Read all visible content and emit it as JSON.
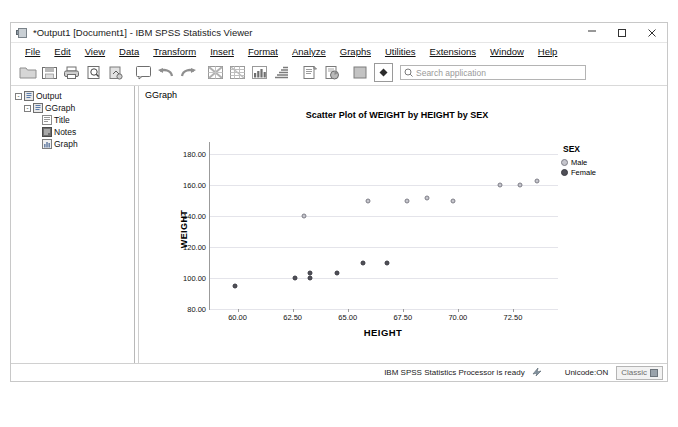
{
  "window": {
    "title": "*Output1 [Document1] - IBM SPSS Statistics Viewer",
    "icon": "spss-viewer-icon",
    "minimize": "minimize-icon",
    "maximize": "maximize-icon",
    "close": "close-icon"
  },
  "menu": [
    {
      "label": "File"
    },
    {
      "label": "Edit"
    },
    {
      "label": "View"
    },
    {
      "label": "Data"
    },
    {
      "label": "Transform"
    },
    {
      "label": "Insert"
    },
    {
      "label": "Format"
    },
    {
      "label": "Analyze"
    },
    {
      "label": "Graphs"
    },
    {
      "label": "Utilities"
    },
    {
      "label": "Extensions"
    },
    {
      "label": "Window"
    },
    {
      "label": "Help"
    }
  ],
  "toolbar": {
    "buttons": [
      {
        "name": "open-file-icon"
      },
      {
        "name": "save-icon"
      },
      {
        "name": "print-icon"
      },
      {
        "name": "print-preview-icon"
      },
      {
        "name": "export-icon"
      },
      {
        "name": "dialog-recall-icon"
      },
      {
        "name": "undo-icon"
      },
      {
        "name": "redo-icon"
      },
      {
        "name": "goto-data-icon"
      },
      {
        "name": "goto-case-icon"
      },
      {
        "name": "variables-icon"
      },
      {
        "name": "run-descriptives-icon"
      },
      {
        "name": "insert-text-icon"
      },
      {
        "name": "insert-object-icon"
      },
      {
        "name": "show-hide-icon"
      },
      {
        "name": "promote-icon"
      }
    ],
    "search": {
      "icon": "search-icon",
      "placeholder": "Search application",
      "value": ""
    }
  },
  "outline": {
    "items": [
      {
        "label": "Output",
        "icon": "output-icon",
        "level": 0,
        "expanded": true
      },
      {
        "label": "GGraph",
        "icon": "ggraph-icon",
        "level": 1,
        "expanded": true
      },
      {
        "label": "Title",
        "icon": "title-icon",
        "level": 2
      },
      {
        "label": "Notes",
        "icon": "notes-icon",
        "level": 2
      },
      {
        "label": "Graph",
        "icon": "graph-icon",
        "level": 2
      }
    ]
  },
  "viewer": {
    "section_label": "GGraph"
  },
  "chart_data": {
    "type": "scatter",
    "title": "Scatter Plot of WEIGHT by HEIGHT by SEX",
    "xlabel": "HEIGHT",
    "ylabel": "WEIGHT",
    "xlim": [
      58.75,
      74.5
    ],
    "ylim": [
      80,
      188
    ],
    "xticks": [
      "60.00",
      "62.50",
      "65.00",
      "67.50",
      "70.00",
      "72.50"
    ],
    "xtick_values": [
      60.0,
      62.5,
      65.0,
      67.5,
      70.0,
      72.5
    ],
    "yticks": [
      "80.00",
      "100.00",
      "120.00",
      "140.00",
      "160.00",
      "180.00"
    ],
    "ytick_values": [
      80,
      100,
      120,
      140,
      160,
      180
    ],
    "grid": true,
    "legend": {
      "title": "SEX",
      "position": "top-right",
      "entries": [
        {
          "label": "Male",
          "color": "#c5c5cc",
          "marker": "open-circle"
        },
        {
          "label": "Female",
          "color": "#4f4f57",
          "marker": "filled-circle"
        }
      ]
    },
    "series": [
      {
        "name": "Male",
        "color": "#c5c5cc",
        "points": [
          {
            "x": 63.0,
            "y": 140.0
          },
          {
            "x": 65.9,
            "y": 150.0
          },
          {
            "x": 67.7,
            "y": 150.0
          },
          {
            "x": 68.6,
            "y": 152.0
          },
          {
            "x": 69.8,
            "y": 150.0
          },
          {
            "x": 71.9,
            "y": 160.0
          },
          {
            "x": 72.8,
            "y": 160.0
          },
          {
            "x": 73.6,
            "y": 163.0
          }
        ]
      },
      {
        "name": "Female",
        "color": "#4f4f57",
        "points": [
          {
            "x": 59.9,
            "y": 95.0
          },
          {
            "x": 62.6,
            "y": 100.0
          },
          {
            "x": 63.3,
            "y": 100.0
          },
          {
            "x": 63.3,
            "y": 103.0
          },
          {
            "x": 64.5,
            "y": 103.0
          },
          {
            "x": 65.7,
            "y": 110.0
          },
          {
            "x": 66.8,
            "y": 110.0
          }
        ]
      }
    ]
  },
  "statusbar": {
    "processor": "IBM SPSS Statistics Processor is ready",
    "processor_icon": "processor-ready-icon",
    "unicode": "Unicode:ON",
    "mode": "Classic",
    "mode_icon": "classic-mode-icon"
  }
}
